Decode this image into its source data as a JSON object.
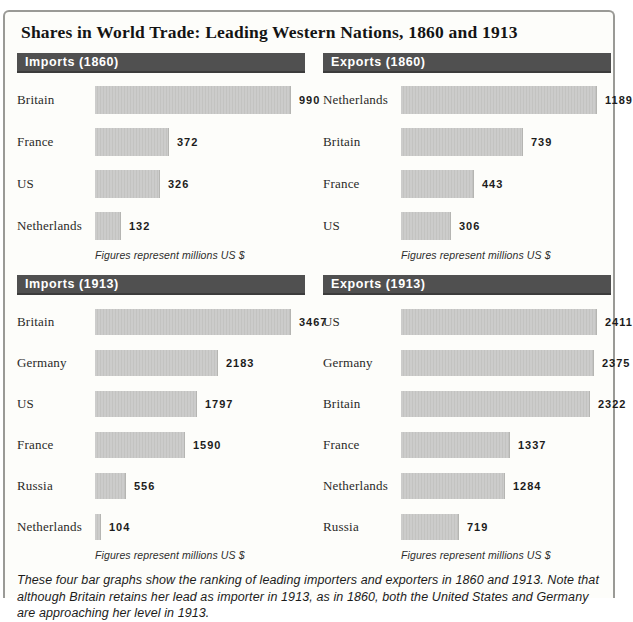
{
  "title": "Shares in World Trade: Leading Western Nations, 1860 and 1913",
  "footnote_label": "Figures represent millions US $",
  "caption": "These four bar graphs show the ranking of leading importers and exporters in 1860 and 1913. Note that although Britain retains her lead as importer in 1913, as in 1860, both the United States and Germany are approaching her level in 1913.",
  "colors": {
    "panel_header_bg": "#505050",
    "panel_header_text": "#ffffff",
    "bar_fill": "#c8c8c6",
    "box_border": "#9a9a96",
    "page_bg": "#fdfdfa"
  },
  "chart_data": [
    {
      "type": "bar",
      "orientation": "horizontal",
      "title": "Imports (1860)",
      "categories": [
        "Britain",
        "France",
        "US",
        "Netherlands"
      ],
      "values": [
        990,
        372,
        326,
        132
      ],
      "unit": "millions US $",
      "value_labels": true,
      "grid": false,
      "legend": false
    },
    {
      "type": "bar",
      "orientation": "horizontal",
      "title": "Exports (1860)",
      "categories": [
        "Netherlands",
        "Britain",
        "France",
        "US"
      ],
      "values": [
        1189,
        739,
        443,
        306
      ],
      "unit": "millions US $",
      "value_labels": true,
      "grid": false,
      "legend": false
    },
    {
      "type": "bar",
      "orientation": "horizontal",
      "title": "Imports (1913)",
      "categories": [
        "Britain",
        "Germany",
        "US",
        "France",
        "Russia",
        "Netherlands"
      ],
      "values": [
        3467,
        2183,
        1797,
        1590,
        556,
        104
      ],
      "unit": "millions US $",
      "value_labels": true,
      "grid": false,
      "legend": false
    },
    {
      "type": "bar",
      "orientation": "horizontal",
      "title": "Exports (1913)",
      "categories": [
        "US",
        "Germany",
        "Britain",
        "France",
        "Netherlands",
        "Russia"
      ],
      "values": [
        2411,
        2375,
        2322,
        1337,
        1284,
        719
      ],
      "unit": "millions US $",
      "value_labels": true,
      "grid": false,
      "legend": false
    }
  ]
}
